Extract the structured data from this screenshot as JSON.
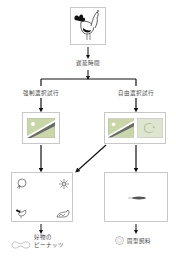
{
  "diagram": {
    "subject": {
      "icon": "rooster-icon"
    },
    "delay_label": "遅延時間",
    "branches": [
      {
        "label": "強制選択試行",
        "stimuli": [
          {
            "icon": "flag-diagonal-icon"
          }
        ],
        "outcome_panel": {
          "icons": [
            "chick-icon",
            "sun-icon",
            "rooster-icon",
            "hen-icon"
          ]
        },
        "reward": {
          "icon": "peanut-icon",
          "label_line1": "好物の",
          "label_line2": "ピーナッツ"
        }
      },
      {
        "label": "自由選択試行",
        "stimuli": [
          {
            "icon": "flag-diagonal-icon"
          },
          {
            "icon": "flag-crescent-icon"
          }
        ],
        "outcome_panel": {
          "icons": [
            "feather-icon"
          ]
        },
        "reward": {
          "icon": "pellet-icon",
          "label": "固型飼料"
        }
      }
    ],
    "colors": {
      "line": "#111111",
      "box_border": "#c8c8c8",
      "flag_green": "#c9d6a8",
      "flag_stripe": "#6a6a6a"
    }
  }
}
